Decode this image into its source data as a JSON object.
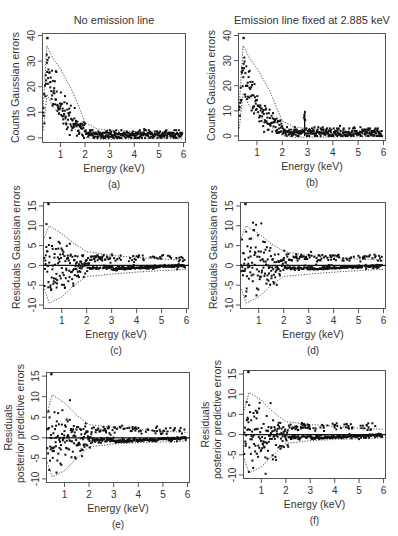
{
  "columns": {
    "left_title": "No emission line",
    "right_title": "Emission line fixed at 2.885 keV"
  },
  "chart_data": [
    {
      "id": "a",
      "caption": "(a)",
      "type": "scatter",
      "title": "No emission line",
      "xlabel": "Energy (keV)",
      "ylabel": "Counts Gaussian errors",
      "xlim": [
        0.25,
        6.1
      ],
      "ylim": [
        -2,
        41
      ],
      "xticks": [
        1,
        2,
        3,
        4,
        5,
        6
      ],
      "yticks": [
        0,
        10,
        20,
        30,
        40
      ],
      "zero_line": false,
      "emission_line": false,
      "frame": {
        "left": 42,
        "top": 33,
        "right": 186,
        "bottom": 143
      },
      "series": [
        {
          "name": "observed counts",
          "style": "points",
          "description": "Spectrum rising from ~8 at 0.3 keV to peak ~30 (max outlier 39) near 0.5 keV, decaying to ~1-2 counts beyond 2 keV"
        },
        {
          "name": "upper band",
          "style": "dotted",
          "x": [
            0.3,
            0.45,
            0.7,
            1.0,
            1.5,
            2.0,
            2.5,
            3.0,
            4.0,
            5.0,
            6.0
          ],
          "y": [
            12,
            36,
            31,
            27,
            18,
            6,
            3.5,
            3,
            2.5,
            2.2,
            2
          ]
        },
        {
          "name": "lower band",
          "style": "dotted",
          "x": [
            0.3,
            0.45,
            0.7,
            1.0,
            1.5,
            2.0,
            2.5,
            3.0,
            4.0,
            5.0,
            6.0
          ],
          "y": [
            3,
            17,
            12,
            9,
            4,
            0.2,
            -0.5,
            -0.5,
            -0.4,
            -0.3,
            -0.3
          ]
        }
      ]
    },
    {
      "id": "b",
      "caption": "(b)",
      "type": "scatter",
      "title": "Emission line fixed at 2.885 keV",
      "xlabel": "Energy (keV)",
      "ylabel": "Counts Gaussian errors",
      "xlim": [
        0.25,
        6.1
      ],
      "ylim": [
        -2,
        41
      ],
      "xticks": [
        1,
        2,
        3,
        4,
        5,
        6
      ],
      "yticks": [
        0,
        10,
        20,
        30,
        40
      ],
      "zero_line": false,
      "emission_line": true,
      "emission_energy": 2.885,
      "emission_peak": 10,
      "frame": {
        "left": 238,
        "top": 33,
        "right": 386,
        "bottom": 141
      },
      "series": [
        {
          "name": "observed counts",
          "style": "points",
          "description": "Same spectrum with a narrow spike reaching ~10 counts at 2.885 keV"
        },
        {
          "name": "upper band",
          "style": "dotted",
          "x": [
            0.3,
            0.45,
            0.7,
            1.0,
            1.5,
            2.0,
            2.5,
            3.0,
            4.0,
            5.0,
            6.0
          ],
          "y": [
            12,
            36,
            31,
            27,
            18,
            6,
            3.5,
            3,
            2.5,
            2.2,
            2
          ]
        },
        {
          "name": "lower band",
          "style": "dotted",
          "x": [
            0.3,
            0.45,
            0.7,
            1.0,
            1.5,
            2.0,
            2.5,
            3.0,
            4.0,
            5.0,
            6.0
          ],
          "y": [
            3,
            17,
            12,
            9,
            4,
            0.2,
            -0.5,
            -0.5,
            -0.4,
            -0.3,
            -0.3
          ]
        }
      ]
    },
    {
      "id": "c",
      "caption": "(c)",
      "type": "scatter",
      "title": "",
      "xlabel": "Energy (keV)",
      "ylabel": "Residuals Gaussian errors",
      "xlim": [
        0.25,
        6.1
      ],
      "ylim": [
        -11,
        16
      ],
      "xticks": [
        1,
        2,
        3,
        4,
        5,
        6
      ],
      "yticks": [
        -10,
        -5,
        0,
        5,
        10,
        15
      ],
      "zero_line": true,
      "emission_line": false,
      "frame": {
        "left": 43,
        "top": 202,
        "right": 189,
        "bottom": 309
      },
      "series": [
        {
          "name": "residuals",
          "style": "points",
          "description": "Residuals scattered within about +/-9 below 2 keV (outlier ~15.5 at 0.45 keV), narrowing to ~-1..3 beyond 3 keV"
        },
        {
          "name": "upper band",
          "style": "dotted",
          "x": [
            0.3,
            0.5,
            1.0,
            1.5,
            2.0,
            3.0,
            4.0,
            5.0,
            6.0
          ],
          "y": [
            7,
            10,
            8,
            5.5,
            3.5,
            2.5,
            2,
            1.6,
            1.3
          ]
        },
        {
          "name": "lower band",
          "style": "dotted",
          "x": [
            0.3,
            0.5,
            1.0,
            1.5,
            2.0,
            3.0,
            4.0,
            5.0,
            6.0
          ],
          "y": [
            -6,
            -9.5,
            -8,
            -5,
            -2.8,
            -2.2,
            -1.7,
            -1.3,
            -1
          ]
        }
      ]
    },
    {
      "id": "d",
      "caption": "(d)",
      "type": "scatter",
      "title": "",
      "xlabel": "Energy (keV)",
      "ylabel": "Residuals Gaussian errors",
      "xlim": [
        0.25,
        6.1
      ],
      "ylim": [
        -11,
        16
      ],
      "xticks": [
        1,
        2,
        3,
        4,
        5,
        6
      ],
      "yticks": [
        -10,
        -5,
        0,
        5,
        10,
        15
      ],
      "zero_line": true,
      "emission_line": false,
      "frame": {
        "left": 240,
        "top": 202,
        "right": 386,
        "bottom": 309
      },
      "series": [
        {
          "name": "residuals",
          "style": "points",
          "description": "Residuals with emission line model; similar spread, slightly reduced structure near 2.9 keV"
        },
        {
          "name": "upper band",
          "style": "dotted",
          "x": [
            0.3,
            0.5,
            1.0,
            1.5,
            2.0,
            3.0,
            4.0,
            5.0,
            6.0
          ],
          "y": [
            7,
            10,
            8,
            5.5,
            3.5,
            2.5,
            2,
            1.6,
            1.3
          ]
        },
        {
          "name": "lower band",
          "style": "dotted",
          "x": [
            0.3,
            0.5,
            1.0,
            1.5,
            2.0,
            3.0,
            4.0,
            5.0,
            6.0
          ],
          "y": [
            -6,
            -9.5,
            -8,
            -5,
            -2.8,
            -2.2,
            -1.7,
            -1.3,
            -1
          ]
        }
      ]
    },
    {
      "id": "e",
      "caption": "(e)",
      "type": "scatter",
      "title": "",
      "xlabel": "Energy (keV)",
      "ylabel": "Residuals posterior predictive errors",
      "ylabel_lines": [
        "Residuals",
        "posterior predictive errors"
      ],
      "xlim": [
        0.25,
        6.1
      ],
      "ylim": [
        -11,
        16
      ],
      "xticks": [
        1,
        2,
        3,
        4,
        5,
        6
      ],
      "yticks": [
        -10,
        -5,
        0,
        5,
        10,
        15
      ],
      "zero_line": true,
      "emission_line": false,
      "frame": {
        "left": 46,
        "top": 372,
        "right": 190,
        "bottom": 483
      },
      "series": [
        {
          "name": "residuals",
          "style": "points",
          "description": "Residuals using posterior predictive errors; band edges jagged near +/-10 at low energy"
        },
        {
          "name": "upper band",
          "style": "dotted",
          "x": [
            0.3,
            0.5,
            1.0,
            1.5,
            2.0,
            3.0,
            4.0,
            5.0,
            6.0
          ],
          "y": [
            6,
            10.5,
            8.5,
            5.5,
            3.2,
            2.5,
            2,
            1.6,
            1.3
          ]
        },
        {
          "name": "lower band",
          "style": "dotted",
          "x": [
            0.3,
            0.5,
            1.0,
            1.5,
            2.0,
            3.0,
            4.0,
            5.0,
            6.0
          ],
          "y": [
            -6,
            -9.5,
            -8,
            -5,
            -2.2,
            -1.5,
            -1.2,
            -1,
            -0.8
          ]
        }
      ]
    },
    {
      "id": "f",
      "caption": "(f)",
      "type": "scatter",
      "title": "",
      "xlabel": "Energy (keV)",
      "ylabel": "Residuals posterior predictive errors",
      "ylabel_lines": [
        "Residuals",
        "posterior predictive errors"
      ],
      "xlim": [
        0.25,
        6.1
      ],
      "ylim": [
        -11,
        16
      ],
      "xticks": [
        1,
        2,
        3,
        4,
        5,
        6
      ],
      "yticks": [
        -10,
        -5,
        0,
        5,
        10,
        15
      ],
      "zero_line": true,
      "emission_line": false,
      "frame": {
        "left": 243,
        "top": 370,
        "right": 386,
        "bottom": 479
      },
      "series": [
        {
          "name": "residuals",
          "style": "points",
          "description": "Posterior predictive residuals with emission line model"
        },
        {
          "name": "upper band",
          "style": "dotted",
          "x": [
            0.3,
            0.5,
            1.0,
            1.5,
            2.0,
            3.0,
            4.0,
            5.0,
            6.0
          ],
          "y": [
            6,
            10.5,
            8.5,
            5.5,
            3.2,
            2.5,
            2,
            1.6,
            1.3
          ]
        },
        {
          "name": "lower band",
          "style": "dotted",
          "x": [
            0.3,
            0.5,
            1.0,
            1.5,
            2.0,
            3.0,
            4.0,
            5.0,
            6.0
          ],
          "y": [
            -6,
            -9.5,
            -8,
            -5,
            -2.2,
            -1.5,
            -1.2,
            -1,
            -0.8
          ]
        }
      ]
    }
  ]
}
